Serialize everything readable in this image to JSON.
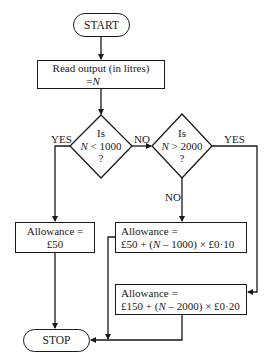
{
  "flowchart": {
    "start": "START",
    "read": {
      "line1": "Read output (in litres)",
      "line2_prefix": "=",
      "line2_var": "N"
    },
    "decision1": {
      "line1": "Is",
      "var": "N",
      "op": " < 1000",
      "line3": "?"
    },
    "decision2": {
      "line1": "Is",
      "var": "N",
      "op": " > 2000",
      "line3": "?"
    },
    "labels": {
      "d1_yes": "YES",
      "d1_no": "NO",
      "d2_yes": "YES",
      "d2_no": "NO"
    },
    "allowance_low": "Allowance = £50",
    "allowance_mid": {
      "line1": "Allowance =",
      "line2_a": "£50 + (",
      "line2_var": "N",
      "line2_b": " – 1000) × £0·10"
    },
    "allowance_high": {
      "line1": "Allowance =",
      "line2_a": "£150 + (",
      "line2_var": "N",
      "line2_b": " – 2000) × £0·20"
    },
    "stop": "STOP"
  }
}
